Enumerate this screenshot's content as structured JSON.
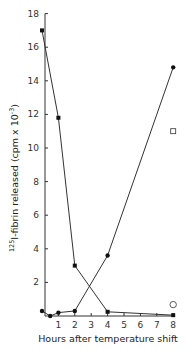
{
  "chart_data": {
    "type": "line",
    "title": "",
    "xlabel": "Hours after temperature shift",
    "ylabel": "125I-fibrin released (cpm x 10^-3)",
    "ylabel_parts": {
      "sup_prefix": "125",
      "main": "I-fibrin released (cpm x 10",
      "sup_exp": "-3",
      "suffix": ")"
    },
    "xlim": [
      0,
      8
    ],
    "ylim": [
      0,
      18
    ],
    "x_ticks": [
      1,
      2,
      3,
      4,
      5,
      6,
      7,
      8
    ],
    "y_ticks": [
      2,
      4,
      6,
      8,
      10,
      12,
      14,
      16,
      18
    ],
    "grid": false,
    "legend": null,
    "series": [
      {
        "name": "declining",
        "marker": "filled-square",
        "x": [
          0,
          1,
          2,
          4,
          8
        ],
        "y": [
          17.0,
          11.8,
          3.0,
          0.25,
          0.05
        ]
      },
      {
        "name": "rising",
        "marker": "filled-circle",
        "x": [
          0,
          0.5,
          1,
          2,
          4,
          8
        ],
        "y": [
          0.3,
          0.0,
          0.2,
          0.3,
          3.6,
          14.8
        ]
      },
      {
        "name": "open-square-point",
        "marker": "open-square",
        "x": [
          8
        ],
        "y": [
          11.0
        ]
      },
      {
        "name": "open-circle-point",
        "marker": "open-circle",
        "x": [
          8
        ],
        "y": [
          0.5
        ]
      }
    ]
  }
}
